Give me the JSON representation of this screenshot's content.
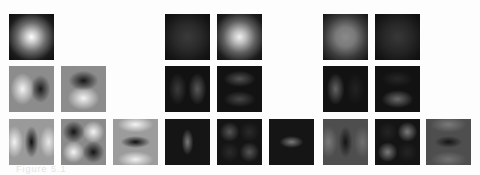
{
  "figure": {
    "caption": "Figure 5.1",
    "groups": [
      {
        "name": "hermite-gaussian-basis",
        "tiles": [
          {
            "row": 0,
            "col": 0,
            "pattern": "gauss-00",
            "bg": "#111",
            "fg": "bright"
          },
          {
            "row": 1,
            "col": 0,
            "pattern": "hg-10",
            "bg": "#888"
          },
          {
            "row": 1,
            "col": 1,
            "pattern": "hg-01",
            "bg": "#888"
          },
          {
            "row": 2,
            "col": 0,
            "pattern": "hg-20",
            "bg": "#999"
          },
          {
            "row": 2,
            "col": 1,
            "pattern": "hg-11",
            "bg": "#888"
          },
          {
            "row": 2,
            "col": 2,
            "pattern": "hg-02",
            "bg": "#999"
          }
        ]
      },
      {
        "name": "magnitude-group-a",
        "tiles": [
          {
            "row": 0,
            "col": 0,
            "pattern": "dim-disk"
          },
          {
            "row": 0,
            "col": 1,
            "pattern": "bright-disk"
          },
          {
            "row": 1,
            "col": 0,
            "pattern": "vertical-pair"
          },
          {
            "row": 1,
            "col": 1,
            "pattern": "horizontal-pair"
          },
          {
            "row": 2,
            "col": 0,
            "pattern": "vertical-blob"
          },
          {
            "row": 2,
            "col": 1,
            "pattern": "quad"
          },
          {
            "row": 2,
            "col": 2,
            "pattern": "horizontal-blob"
          }
        ]
      },
      {
        "name": "magnitude-group-b",
        "tiles": [
          {
            "row": 0,
            "col": 0,
            "pattern": "mid-disk"
          },
          {
            "row": 0,
            "col": 1,
            "pattern": "dim-disk"
          },
          {
            "row": 1,
            "col": 0,
            "pattern": "left-blob"
          },
          {
            "row": 1,
            "col": 1,
            "pattern": "bottom-blob"
          },
          {
            "row": 2,
            "col": 0,
            "pattern": "dark-vertical"
          },
          {
            "row": 2,
            "col": 1,
            "pattern": "quad-diag"
          },
          {
            "row": 2,
            "col": 2,
            "pattern": "dark-horizontal"
          }
        ]
      }
    ]
  }
}
